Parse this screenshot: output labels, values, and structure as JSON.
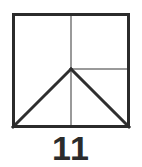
{
  "figure": {
    "label": "11",
    "shape_name": "square-with-inscribed-triangle",
    "colors": {
      "background": "#ffffff",
      "outline": "#2b2b2b",
      "construction_line": "#9a9a9a",
      "diagonal": "#2f2f2f",
      "label_text": "#2b2b2b"
    },
    "geometry": {
      "square": {
        "x": 12,
        "y": 13,
        "width": 118,
        "height": 115
      },
      "center_point": {
        "x": 71,
        "y": 69
      },
      "outline_stroke_width": 3,
      "construction_stroke_width": 2,
      "diagonal_stroke_width": 3,
      "vertical_center_line": {
        "x1": 71,
        "y1": 13,
        "x2": 71,
        "y2": 128
      },
      "horizontal_right_line": {
        "x1": 71,
        "y1": 69,
        "x2": 130,
        "y2": 69
      },
      "diagonal_left": {
        "x1": 71,
        "y1": 69,
        "x2": 12,
        "y2": 128
      },
      "diagonal_right": {
        "x1": 71,
        "y1": 69,
        "x2": 130,
        "y2": 128
      }
    }
  }
}
